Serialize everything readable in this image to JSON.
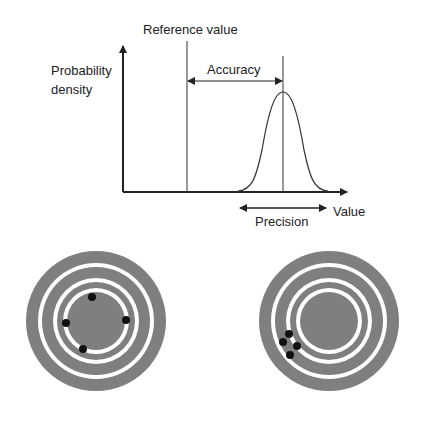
{
  "diagram": {
    "labels": {
      "y_axis_line1": "Probability",
      "y_axis_line2": "density",
      "x_axis": "Value",
      "reference": "Reference value",
      "accuracy": "Accuracy",
      "precision": "Precision"
    },
    "colors": {
      "line": "#222222",
      "ring": "#7f7f7f",
      "gap": "#ffffff",
      "dot": "#111111"
    },
    "targets": [
      {
        "name": "accurate-imprecise",
        "center": [
          96,
          321
        ],
        "dots": [
          [
            92,
            297
          ],
          [
            66,
            323
          ],
          [
            126,
            320
          ],
          [
            83,
            349
          ]
        ]
      },
      {
        "name": "precise-inaccurate",
        "center": [
          329,
          321
        ],
        "dots": [
          [
            289,
            334
          ],
          [
            283,
            342
          ],
          [
            297,
            346
          ],
          [
            290,
            355
          ]
        ]
      }
    ]
  }
}
